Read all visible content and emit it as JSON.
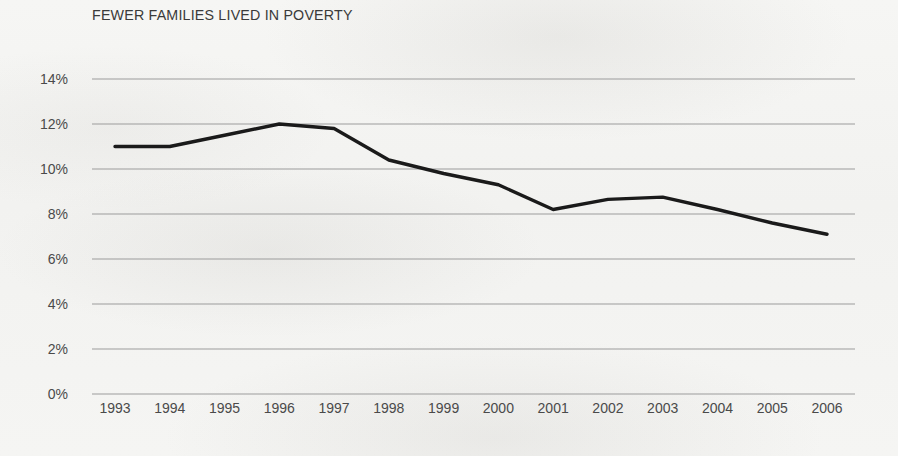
{
  "chart_data": {
    "type": "line",
    "title": "FEWER FAMILIES LIVED IN POVERTY",
    "xlabel": "",
    "ylabel": "",
    "categories": [
      "1993",
      "1994",
      "1995",
      "1996",
      "1997",
      "1998",
      "1999",
      "2000",
      "2001",
      "2002",
      "2003",
      "2004",
      "2005",
      "2006"
    ],
    "values": [
      11.0,
      11.0,
      11.5,
      12.0,
      11.8,
      10.4,
      9.8,
      9.3,
      8.2,
      8.65,
      8.75,
      8.2,
      7.6,
      7.1
    ],
    "series": [
      {
        "name": "Families in poverty",
        "values": [
          11.0,
          11.0,
          11.5,
          12.0,
          11.8,
          10.4,
          9.8,
          9.3,
          8.2,
          8.65,
          8.75,
          8.2,
          7.6,
          7.1
        ]
      }
    ],
    "ylim": [
      0,
      14
    ],
    "ytick_step": 2,
    "ytick_labels": [
      "0%",
      "2%",
      "4%",
      "6%",
      "8%",
      "10%",
      "12%",
      "14%"
    ],
    "ytick_values": [
      0,
      2,
      4,
      6,
      8,
      10,
      12,
      14
    ],
    "grid": "horizontal",
    "legend": "none",
    "line_color": "#1a1a1a",
    "grid_color": "#9b9b9b",
    "text_color": "#4a4a4a",
    "background_color": "#f4f4f2"
  }
}
